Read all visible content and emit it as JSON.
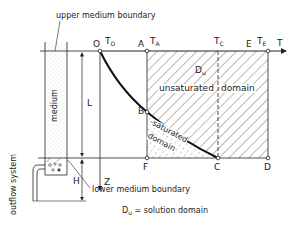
{
  "figure": {
    "labels": {
      "upper_boundary": "upper medium boundary",
      "lower_boundary": "lower medium boundary",
      "medium": "medium",
      "outflow": "outflow system",
      "L": "L",
      "H": "H",
      "Z": "Z",
      "T": "T",
      "unsaturated": "unsaturated",
      "domain": "domain",
      "saturated": "-saturated",
      "saturated_domain": "domain",
      "Du": "D",
      "Du_sub": "u",
      "legend_sym": "D",
      "legend_sub": "u",
      "legend_text": "= solution domain"
    },
    "points": {
      "O": "O",
      "A": "A",
      "E": "E",
      "B": "B",
      "F": "F",
      "C": "C",
      "D": "D"
    },
    "times": {
      "T0": "T",
      "T0_sub": "O",
      "TA": "T",
      "TA_sub": "A",
      "TC": "T",
      "TC_sub": "C",
      "TE": "T",
      "TE_sub": "E"
    }
  }
}
